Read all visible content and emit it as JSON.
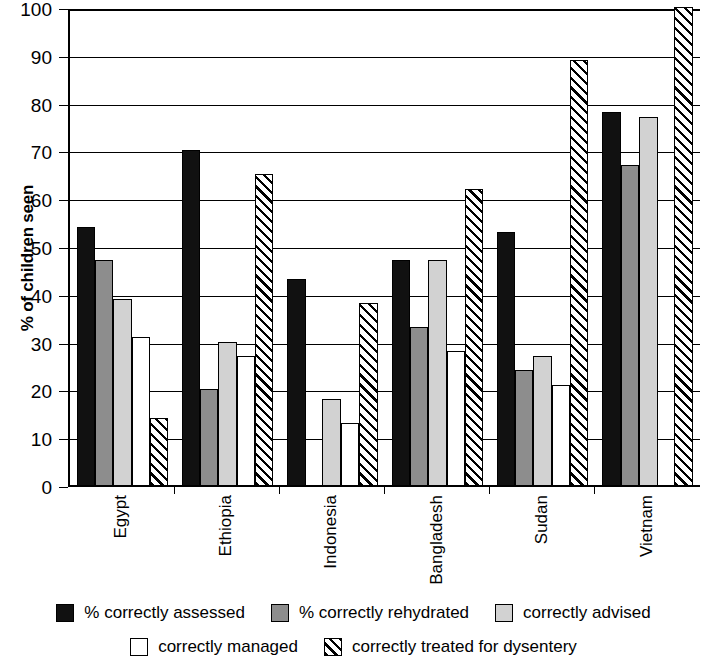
{
  "chart_data": {
    "type": "bar",
    "title": "",
    "subtitle": "",
    "xlabel": "",
    "ylabel": "% of children seen",
    "ylim": [
      0,
      100
    ],
    "ytick_step": 10,
    "yticks": [
      0,
      10,
      20,
      30,
      40,
      50,
      60,
      70,
      80,
      90,
      100
    ],
    "grid": true,
    "legend_position": "bottom",
    "categories": [
      "Egypt",
      "Ethiopia",
      "Indonesia",
      "Bangladesh",
      "Sudan",
      "Vietnam"
    ],
    "series": [
      {
        "name": "% correctly assessed",
        "key": "assessed",
        "color": "#111111",
        "pattern": "solid",
        "values": [
          54,
          70,
          43,
          47,
          53,
          78
        ]
      },
      {
        "name": "% correctly rehydrated",
        "key": "rehydrated",
        "color": "#8d8d8d",
        "pattern": "solid",
        "values": [
          47,
          20,
          0,
          33,
          24,
          67
        ]
      },
      {
        "name": "correctly advised",
        "key": "advised",
        "color": "#d2d2d2",
        "pattern": "solid",
        "values": [
          39,
          30,
          18,
          47,
          27,
          77
        ]
      },
      {
        "name": "correctly managed",
        "key": "managed",
        "color": "#ffffff",
        "pattern": "solid",
        "values": [
          31,
          27,
          13,
          28,
          21,
          0
        ]
      },
      {
        "name": "correctly treated for dysentery",
        "key": "dysentery",
        "color": "#ffffff",
        "pattern": "diagonal-hatch",
        "values": [
          14,
          65,
          38,
          62,
          89,
          100
        ]
      }
    ]
  },
  "legend": {
    "row1": [
      {
        "label": "% correctly assessed",
        "swatch": "solid-black"
      },
      {
        "label": "% correctly rehydrated",
        "swatch": "solid-dark-gray"
      },
      {
        "label": "correctly advised",
        "swatch": "solid-light-gray"
      }
    ],
    "row2": [
      {
        "label": "correctly managed",
        "swatch": "solid-white"
      },
      {
        "label": "correctly treated for dysentery",
        "swatch": "diagonal-hatch"
      }
    ]
  }
}
